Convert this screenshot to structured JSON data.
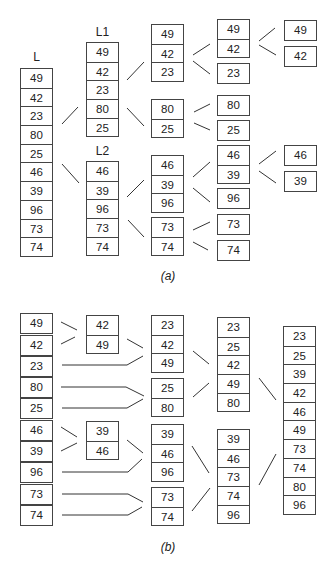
{
  "part_a": {
    "caption": "(a)",
    "labels": {
      "L": "L",
      "L1": "L1",
      "L2": "L2"
    },
    "col1": {
      "L": [
        "49",
        "42",
        "23",
        "80",
        "25",
        "46",
        "39",
        "96",
        "73",
        "74"
      ]
    },
    "col2": {
      "L1": [
        "49",
        "42",
        "23",
        "80",
        "25"
      ],
      "L2": [
        "46",
        "39",
        "96",
        "73",
        "74"
      ]
    },
    "col3": [
      [
        "49",
        "42",
        "23"
      ],
      [
        "80",
        "25"
      ],
      [
        "46",
        "39",
        "96"
      ],
      [
        "73",
        "74"
      ]
    ],
    "col4": [
      [
        "49",
        "42"
      ],
      [
        "23"
      ],
      [
        "80"
      ],
      [
        "25"
      ],
      [
        "46",
        "39"
      ],
      [
        "96"
      ],
      [
        "73"
      ],
      [
        "74"
      ]
    ],
    "col5": [
      [
        "49"
      ],
      [
        "42"
      ],
      [
        "46"
      ],
      [
        "39"
      ]
    ]
  },
  "part_b": {
    "caption": "(b)",
    "col1": [
      [
        "49"
      ],
      [
        "42"
      ],
      [
        "23"
      ],
      [
        "80"
      ],
      [
        "25"
      ],
      [
        "46"
      ],
      [
        "39"
      ],
      [
        "96"
      ],
      [
        "73"
      ],
      [
        "74"
      ]
    ],
    "col2": [
      [
        "42",
        "49"
      ],
      [
        "39",
        "46"
      ]
    ],
    "col3": [
      [
        "23",
        "42",
        "49"
      ],
      [
        "25",
        "80"
      ],
      [
        "39",
        "46",
        "96"
      ],
      [
        "73",
        "74"
      ]
    ],
    "col4": [
      [
        "23",
        "25",
        "42",
        "49",
        "80"
      ],
      [
        "39",
        "46",
        "73",
        "74",
        "96"
      ]
    ],
    "col5": [
      [
        "23",
        "25",
        "39",
        "42",
        "46",
        "49",
        "73",
        "74",
        "80",
        "96"
      ]
    ]
  }
}
